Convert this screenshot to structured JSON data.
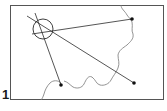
{
  "figure": {
    "label": "1",
    "type": "map-resection-diagram",
    "frame": {
      "x": 10,
      "y": 5,
      "width": 154,
      "height": 95
    },
    "colors": {
      "line": "#2a2a2a",
      "frame": "#555555",
      "river": "#777777",
      "point": "#111111",
      "background": "#ffffff"
    },
    "landmarks": [
      {
        "name": "top-right-point",
        "x": 132,
        "y": 19
      },
      {
        "name": "bottom-right-point",
        "x": 134,
        "y": 83
      },
      {
        "name": "bottom-left-point",
        "x": 61,
        "y": 85
      }
    ],
    "position_circle": {
      "cx": 43,
      "cy": 29,
      "r": 10
    },
    "bearing_lines": [
      {
        "from": [
          32,
          34
        ],
        "to": [
          132,
          19
        ]
      },
      {
        "from": [
          27,
          16
        ],
        "to": [
          134,
          83
        ]
      },
      {
        "from": [
          35,
          13
        ],
        "to": [
          61,
          85
        ]
      }
    ]
  }
}
